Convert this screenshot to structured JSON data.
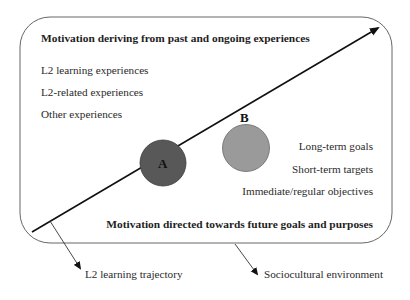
{
  "diagram": {
    "top_heading": "Motivation deriving from past and ongoing experiences",
    "past_experiences": [
      "L2 learning experiences",
      "L2-related experiences",
      "Other experiences"
    ],
    "future_goals": [
      "Long-term goals",
      "Short-term targets",
      "Immediate/regular objectives"
    ],
    "bottom_heading": "Motivation directed towards future goals and purposes",
    "nodes": [
      {
        "label": "A",
        "color": "#585858"
      },
      {
        "label": "B",
        "color": "#9a9a9a"
      }
    ],
    "callouts": {
      "trajectory": "L2 learning trajectory",
      "environment": "Sociocultural environment"
    },
    "colors": {
      "stroke": "#111111",
      "box_border": "#666666",
      "background": "#ffffff"
    }
  }
}
